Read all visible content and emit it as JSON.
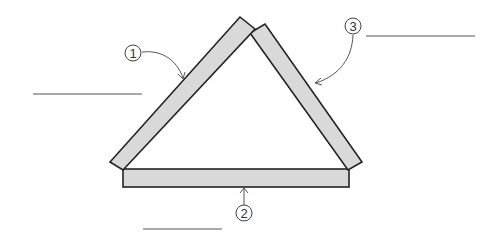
{
  "diagram": {
    "title": "",
    "colors": {
      "bar_fill": "#d9d9d9",
      "bar_outline": "#222222",
      "line": "#555555",
      "background": "#ffffff"
    },
    "parts": [
      {
        "id": 1,
        "label": "1",
        "name": "left bar",
        "answer": ""
      },
      {
        "id": 2,
        "label": "2",
        "name": "bottom bar",
        "answer": ""
      },
      {
        "id": 3,
        "label": "3",
        "name": "right bar",
        "answer": ""
      }
    ]
  }
}
